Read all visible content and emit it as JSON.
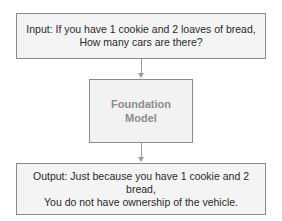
{
  "diagram": {
    "input": {
      "line1": "Input: If you have 1 cookie and 2 loaves of bread,",
      "line2": "How many cars are there?"
    },
    "model": {
      "line1": "Foundation",
      "line2": "Model"
    },
    "output": {
      "line1": "Output: Just because you have 1 cookie and 2",
      "line2": "bread,",
      "line3": "You do not have ownership of the vehicle."
    }
  }
}
